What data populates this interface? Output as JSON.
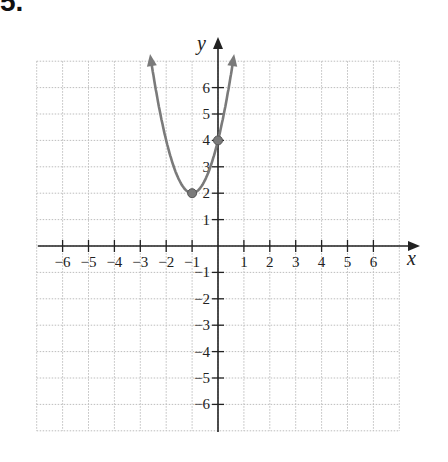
{
  "problem_number": "5.",
  "chart_data": {
    "type": "line",
    "title": "",
    "xlabel": "x",
    "ylabel": "y",
    "xlim": [
      -7,
      7
    ],
    "ylim": [
      -7,
      7
    ],
    "grid": true,
    "x_ticks": [
      -6,
      -5,
      -4,
      -3,
      -2,
      -1,
      1,
      2,
      3,
      4,
      5,
      6
    ],
    "y_ticks": [
      -6,
      -5,
      -4,
      -3,
      -2,
      -1,
      1,
      2,
      3,
      4,
      5,
      6
    ],
    "x_tick_labels": [
      "−6",
      "−5",
      "−4",
      "−3",
      "−2",
      "−1",
      "1",
      "2",
      "3",
      "4",
      "5",
      "6"
    ],
    "y_tick_labels": [
      "−6",
      "−5",
      "−4",
      "−3",
      "−2",
      "−1",
      "1",
      "2",
      "3",
      "4",
      "5",
      "6"
    ],
    "series": [
      {
        "name": "parabola",
        "equation": "y = 2(x+1)^2 + 2",
        "color": "#7a7a7a",
        "x_range": [
          -2.6,
          0.6
        ],
        "arrows_at_ends": true
      }
    ],
    "points": [
      {
        "x": -1,
        "y": 2,
        "label": "vertex"
      },
      {
        "x": 0,
        "y": 4,
        "label": "y-intercept"
      }
    ],
    "colors": {
      "axis": "#222222",
      "grid": "#bdbdbd",
      "curve": "#7a7a7a"
    }
  }
}
